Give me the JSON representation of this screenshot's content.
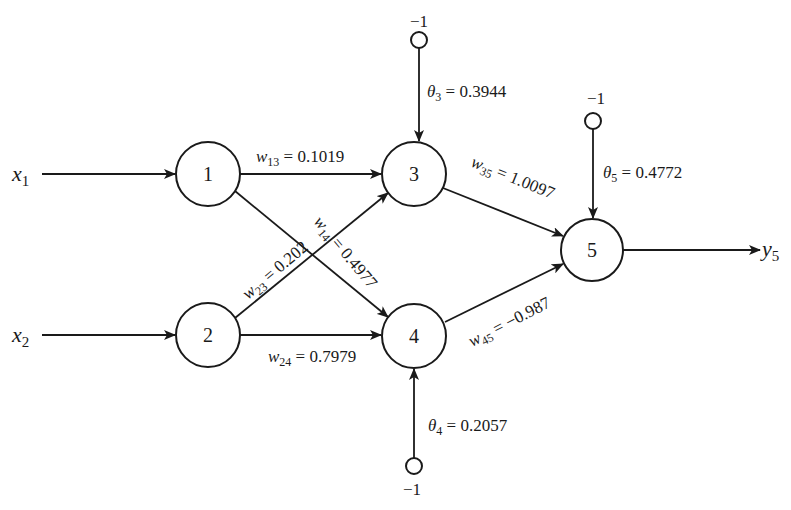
{
  "diagram": {
    "type": "neural-network",
    "inputs": [
      {
        "id": "x1",
        "symbol": "x",
        "sub": "1",
        "to_node": 1
      },
      {
        "id": "x2",
        "symbol": "x",
        "sub": "2",
        "to_node": 2
      }
    ],
    "output": {
      "id": "y5",
      "symbol": "y",
      "sub": "5",
      "from_node": 5
    },
    "nodes": [
      {
        "id": 1,
        "label": "1",
        "layer": "input"
      },
      {
        "id": 2,
        "label": "2",
        "layer": "input"
      },
      {
        "id": 3,
        "label": "3",
        "layer": "hidden"
      },
      {
        "id": 4,
        "label": "4",
        "layer": "hidden"
      },
      {
        "id": 5,
        "label": "5",
        "layer": "output"
      }
    ],
    "weights": [
      {
        "from": 1,
        "to": 3,
        "symbol": "w",
        "sub": "13",
        "eq": " = ",
        "value": "0.1019"
      },
      {
        "from": 1,
        "to": 4,
        "symbol": "w",
        "sub": "14",
        "eq": " = ",
        "value": "0.4977"
      },
      {
        "from": 2,
        "to": 3,
        "symbol": "w",
        "sub": "23",
        "eq": " = ",
        "value": "0.202"
      },
      {
        "from": 2,
        "to": 4,
        "symbol": "w",
        "sub": "24",
        "eq": " = ",
        "value": "0.7979"
      },
      {
        "from": 3,
        "to": 5,
        "symbol": "w",
        "sub": "35",
        "eq": " = ",
        "value": "1.0097"
      },
      {
        "from": 4,
        "to": 5,
        "symbol": "w",
        "sub": "45",
        "eq": " = ",
        "value": "−0.987"
      }
    ],
    "thresholds": [
      {
        "node": 3,
        "symbol": "θ",
        "sub": "3",
        "eq": " = ",
        "value": "0.3944",
        "bias_input": "−1"
      },
      {
        "node": 4,
        "symbol": "θ",
        "sub": "4",
        "eq": " = ",
        "value": "0.2057",
        "bias_input": "−1"
      },
      {
        "node": 5,
        "symbol": "θ",
        "sub": "5",
        "eq": " = ",
        "value": "0.4772",
        "bias_input": "−1"
      }
    ]
  }
}
